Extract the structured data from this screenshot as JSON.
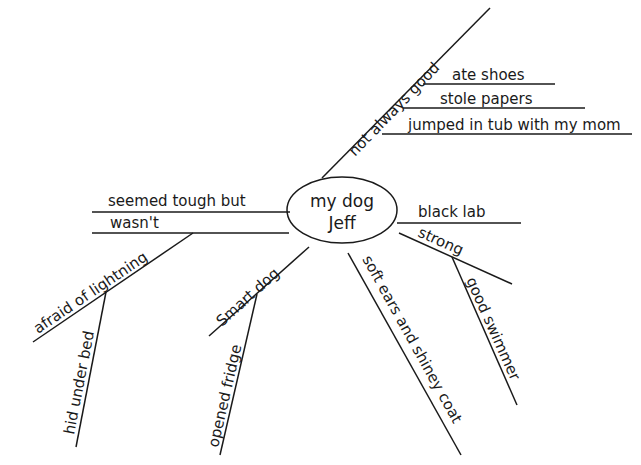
{
  "diagram": {
    "type": "mind-map",
    "center": {
      "line1": "my dog",
      "line2": "Jeff"
    },
    "branches": [
      {
        "label": "not always good",
        "children": [
          {
            "label": "ate shoes"
          },
          {
            "label": "stole papers"
          },
          {
            "label": "jumped in tub with my mom"
          }
        ]
      },
      {
        "label": "black lab"
      },
      {
        "label": "strong",
        "children": [
          {
            "label": "good swimmer"
          }
        ]
      },
      {
        "label": "soft ears and shiney coat"
      },
      {
        "label": "Smart dog",
        "children": [
          {
            "label": "opened fridge"
          }
        ]
      },
      {
        "label_line1": "seemed tough but",
        "label_line2": "wasn't"
      },
      {
        "label": "afraid of lightning",
        "children": [
          {
            "label": "hid under bed"
          }
        ]
      }
    ],
    "colors": {
      "ink": "#1a1a1a",
      "background": "#ffffff"
    }
  }
}
